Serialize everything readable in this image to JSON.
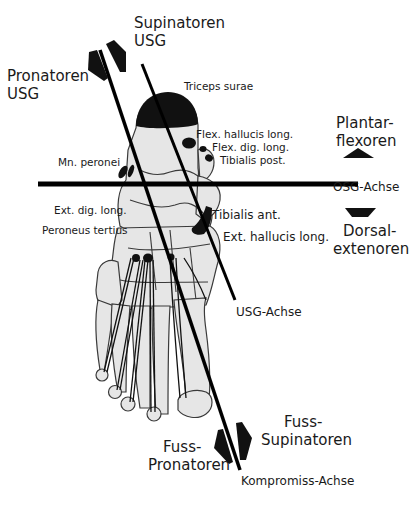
{
  "diagram": {
    "labels": {
      "supinatoren_usg": [
        "Supinatoren",
        "USG"
      ],
      "pronatoren_usg": [
        "Pronatoren",
        "USG"
      ],
      "triceps_surae": "Triceps surae",
      "flex_hallucis_long": "Flex. hallucis long.",
      "flex_dig_long": "Flex. dig. long.",
      "tibialis_post": "Tibialis post.",
      "mn_peronei": "Mn. peronei",
      "plantarflexoren": [
        "Plantar-",
        "flexoren"
      ],
      "osg_achse": "OSG-Achse",
      "dorsalextenoren": [
        "Dorsal-",
        "extenoren"
      ],
      "ext_dig_long": "Ext. dig. long.",
      "peroneus_tertius": "Peroneus tertius",
      "tibialis_ant": "Tibialis ant.",
      "ext_hallucis_long": "Ext. hallucis long.",
      "usg_achse": "USG-Achse",
      "fuss_supinatoren": [
        "Fuss-",
        "Supinatoren"
      ],
      "fuss_pronatoren": [
        "Fuss-",
        "Pronatoren"
      ],
      "kompromiss_achse": "Kompromiss-Achse"
    },
    "axes": [
      {
        "name": "OSG-Achse",
        "orientation": "horizontal"
      },
      {
        "name": "USG-Achse",
        "orientation": "oblique"
      },
      {
        "name": "Kompromiss-Achse",
        "orientation": "oblique"
      }
    ],
    "colors": {
      "line": "#000000",
      "bone_fill": "#e6e6e6",
      "bone_stroke": "#3a3a3a",
      "muscle": "#111111",
      "background": "#ffffff"
    }
  }
}
